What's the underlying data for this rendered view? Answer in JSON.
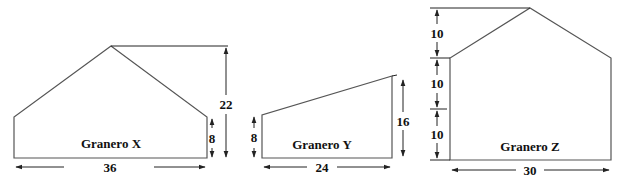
{
  "diagram": {
    "barns": [
      {
        "name": "Granero X",
        "dimensions": {
          "width": "36",
          "total_height": "22",
          "wall_height": "8"
        }
      },
      {
        "name": "Granero Y",
        "dimensions": {
          "width": "24",
          "left_wall_height": "8",
          "right_wall_height": "16"
        }
      },
      {
        "name": "Granero Z",
        "dimensions": {
          "width": "30",
          "roof_height": "10",
          "upper_wall_height": "10",
          "lower_wall_height": "10"
        }
      }
    ],
    "colors": {
      "outline": "#555555",
      "text": "#111111"
    }
  }
}
